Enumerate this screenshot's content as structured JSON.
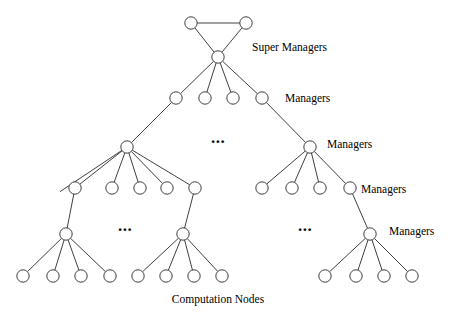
{
  "figure": {
    "width": 465,
    "height": 320,
    "background_color": "#ffffff",
    "stroke_color": "#2a2a2a",
    "node_fill_color": "#ffffff",
    "text_color": "#000000"
  },
  "labels": {
    "super_managers": "Super Managers",
    "managers_level_2": "Managers",
    "managers_level_3": "Managers",
    "managers_level_4": "Managers",
    "managers_level_5": "Managers",
    "computation_nodes": "Computation Nodes",
    "ellipsis": "..."
  },
  "chart_data": {
    "type": "diagram",
    "levels": [
      {
        "index": 0,
        "name": "super-managers-peer-row",
        "label": "Super Managers",
        "node_count": 2,
        "y": 23,
        "node_x": [
          191,
          246
        ]
      },
      {
        "index": 1,
        "name": "super-manager-root",
        "label": "Super Managers",
        "node_count": 1,
        "y": 57,
        "node_x": [
          218
        ]
      },
      {
        "index": 2,
        "name": "managers-level-2",
        "label": "Managers",
        "node_count": 4,
        "y": 98,
        "node_x": [
          176,
          205,
          233,
          262
        ]
      },
      {
        "index": 3,
        "name": "managers-level-3",
        "label": "Managers",
        "node_count": 2,
        "y": 147,
        "node_x": [
          127,
          310
        ],
        "ellipsis_x": [
          218
        ],
        "ellipsis_y": 139
      },
      {
        "index": 4,
        "name": "managers-level-4",
        "label": "Managers",
        "node_count": 9,
        "y": 188,
        "node_x": [
          75,
          112,
          140,
          167,
          195,
          262,
          292,
          320,
          350
        ]
      },
      {
        "index": 5,
        "name": "managers-level-5",
        "label": "Managers",
        "node_count": 3,
        "y": 234,
        "node_x": [
          66,
          183,
          370
        ],
        "ellipsis_x": [
          125,
          305
        ],
        "ellipsis_y": 227
      },
      {
        "index": 6,
        "name": "computation-nodes",
        "label": "Computation Nodes",
        "node_count": 12,
        "y": 276,
        "node_x": [
          23,
          53,
          81,
          110,
          138,
          166,
          194,
          222,
          325,
          356,
          384,
          412
        ]
      }
    ],
    "label_positions": [
      {
        "key": "super_managers",
        "x": 252,
        "y": 48,
        "anchor": "start"
      },
      {
        "key": "managers_level_2",
        "x": 285,
        "y": 99,
        "anchor": "start"
      },
      {
        "key": "managers_level_3",
        "x": 327,
        "y": 145,
        "anchor": "start"
      },
      {
        "key": "managers_level_4",
        "x": 361,
        "y": 190,
        "anchor": "start"
      },
      {
        "key": "managers_level_5",
        "x": 389,
        "y": 232,
        "anchor": "start"
      },
      {
        "key": "computation_nodes",
        "x": 218,
        "y": 300,
        "anchor": "middle"
      }
    ],
    "edges": [
      {
        "from": [
          191,
          23
        ],
        "to": [
          246,
          23
        ],
        "kind": "peer-link"
      },
      {
        "from": [
          191,
          23
        ],
        "to": [
          218,
          57
        ],
        "kind": "tree-link"
      },
      {
        "from": [
          246,
          23
        ],
        "to": [
          218,
          57
        ],
        "kind": "tree-link"
      },
      {
        "from": [
          218,
          57
        ],
        "to": [
          176,
          98
        ],
        "kind": "tree-link"
      },
      {
        "from": [
          218,
          57
        ],
        "to": [
          205,
          98
        ],
        "kind": "tree-link"
      },
      {
        "from": [
          218,
          57
        ],
        "to": [
          233,
          98
        ],
        "kind": "tree-link"
      },
      {
        "from": [
          218,
          57
        ],
        "to": [
          262,
          98
        ],
        "kind": "tree-link"
      },
      {
        "from": [
          176,
          98
        ],
        "to": [
          127,
          147
        ],
        "kind": "tree-link"
      },
      {
        "from": [
          262,
          98
        ],
        "to": [
          310,
          147
        ],
        "kind": "tree-link"
      },
      {
        "from": [
          127,
          147
        ],
        "to": [
          75,
          188
        ],
        "kind": "tree-link"
      },
      {
        "from": [
          127,
          147
        ],
        "to": [
          112,
          188
        ],
        "kind": "tree-link"
      },
      {
        "from": [
          127,
          147
        ],
        "to": [
          140,
          188
        ],
        "kind": "tree-link"
      },
      {
        "from": [
          127,
          147
        ],
        "to": [
          167,
          188
        ],
        "kind": "tree-link"
      },
      {
        "from": [
          127,
          147
        ],
        "to": [
          195,
          188
        ],
        "kind": "tree-link"
      },
      {
        "from": [
          127,
          147
        ],
        "to": [
          55,
          195
        ],
        "kind": "tree-link"
      },
      {
        "from": [
          310,
          147
        ],
        "to": [
          262,
          188
        ],
        "kind": "tree-link"
      },
      {
        "from": [
          310,
          147
        ],
        "to": [
          292,
          188
        ],
        "kind": "tree-link"
      },
      {
        "from": [
          310,
          147
        ],
        "to": [
          320,
          188
        ],
        "kind": "tree-link"
      },
      {
        "from": [
          310,
          147
        ],
        "to": [
          350,
          188
        ],
        "kind": "tree-link"
      },
      {
        "from": [
          75,
          188
        ],
        "to": [
          66,
          234
        ],
        "kind": "tree-link"
      },
      {
        "from": [
          195,
          188
        ],
        "to": [
          183,
          234
        ],
        "kind": "tree-link"
      },
      {
        "from": [
          350,
          188
        ],
        "to": [
          370,
          234
        ],
        "kind": "tree-link"
      },
      {
        "from": [
          66,
          234
        ],
        "to": [
          23,
          276
        ],
        "kind": "tree-link"
      },
      {
        "from": [
          66,
          234
        ],
        "to": [
          53,
          276
        ],
        "kind": "tree-link"
      },
      {
        "from": [
          66,
          234
        ],
        "to": [
          81,
          276
        ],
        "kind": "tree-link"
      },
      {
        "from": [
          66,
          234
        ],
        "to": [
          110,
          276
        ],
        "kind": "tree-link"
      },
      {
        "from": [
          183,
          234
        ],
        "to": [
          138,
          276
        ],
        "kind": "tree-link"
      },
      {
        "from": [
          183,
          234
        ],
        "to": [
          166,
          276
        ],
        "kind": "tree-link"
      },
      {
        "from": [
          183,
          234
        ],
        "to": [
          194,
          276
        ],
        "kind": "tree-link"
      },
      {
        "from": [
          183,
          234
        ],
        "to": [
          222,
          276
        ],
        "kind": "tree-link"
      },
      {
        "from": [
          370,
          234
        ],
        "to": [
          325,
          276
        ],
        "kind": "tree-link"
      },
      {
        "from": [
          370,
          234
        ],
        "to": [
          356,
          276
        ],
        "kind": "tree-link"
      },
      {
        "from": [
          370,
          234
        ],
        "to": [
          384,
          276
        ],
        "kind": "tree-link"
      },
      {
        "from": [
          370,
          234
        ],
        "to": [
          412,
          276
        ],
        "kind": "tree-link"
      }
    ],
    "node_radius": 6.2,
    "ellipsis_markers": [
      {
        "x": 218,
        "y": 139
      },
      {
        "x": 125,
        "y": 227
      },
      {
        "x": 305,
        "y": 227
      }
    ]
  }
}
